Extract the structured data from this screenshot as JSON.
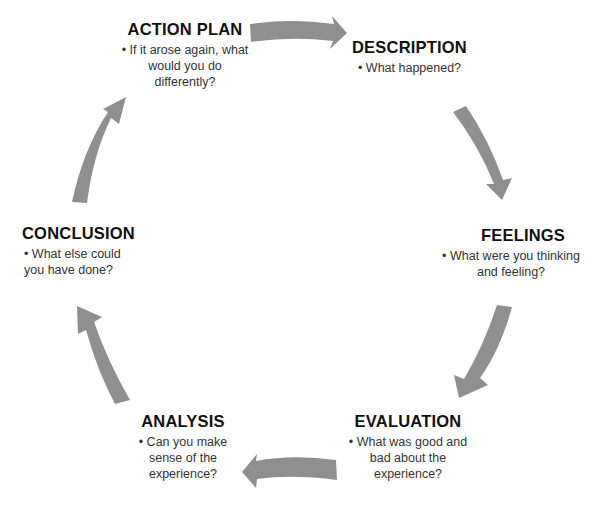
{
  "diagram": {
    "type": "cycle",
    "arrow_color": "#8f8f8f",
    "stages": [
      {
        "id": "description",
        "title": "DESCRIPTION",
        "bullet": "• What happened?"
      },
      {
        "id": "feelings",
        "title": "FEELINGS",
        "bullet": "• What were you thinking and feeling?"
      },
      {
        "id": "evaluation",
        "title": "EVALUATION",
        "bullet": "• What was good and bad about the experience?"
      },
      {
        "id": "analysis",
        "title": "ANALYSIS",
        "bullet": "• Can you make sense of the experience?"
      },
      {
        "id": "conclusion",
        "title": "CONCLUSION",
        "bullet": "• What else could you have done?"
      },
      {
        "id": "action_plan",
        "title": "ACTION PLAN",
        "bullet": "• If it arose again, what would you do differently?"
      }
    ],
    "edges": [
      {
        "from": "action_plan",
        "to": "description"
      },
      {
        "from": "description",
        "to": "feelings"
      },
      {
        "from": "feelings",
        "to": "evaluation"
      },
      {
        "from": "evaluation",
        "to": "analysis"
      },
      {
        "from": "analysis",
        "to": "conclusion"
      },
      {
        "from": "conclusion",
        "to": "action_plan"
      }
    ]
  }
}
